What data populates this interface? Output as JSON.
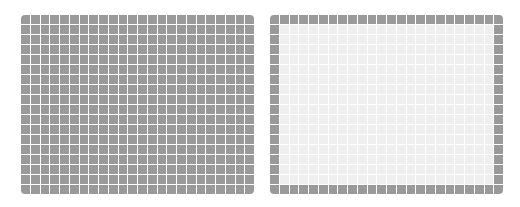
{
  "grids": [
    {
      "id": "grid-left",
      "columns": 24,
      "rows": 18,
      "fill": "all",
      "cell_color": "#9a9a9a",
      "line_color": "#ffffff"
    },
    {
      "id": "grid-right",
      "columns": 24,
      "rows": 18,
      "fill": "border-only",
      "cell_color": "#9a9a9a",
      "interior_color": "#efefef",
      "line_color": "#ffffff"
    }
  ]
}
